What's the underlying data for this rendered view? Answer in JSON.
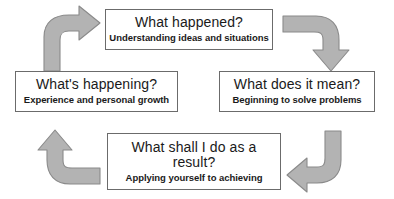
{
  "diagram": {
    "colors": {
      "arrow_fill": "#b3b3b3",
      "arrow_stroke": "#8a8a8a",
      "box_border": "#6b6b6b",
      "text": "#1a1a1a",
      "background": "#ffffff"
    },
    "nodes": [
      {
        "id": "what-happened",
        "title": "What happened?",
        "subtitle": "Understanding ideas and situations",
        "position": "top"
      },
      {
        "id": "what-does-it-mean",
        "title": "What does it mean?",
        "subtitle": "Beginning to solve problems",
        "position": "right"
      },
      {
        "id": "what-shall-i-do",
        "title": "What shall I do as a\nresult?",
        "subtitle": "Applying yourself to achieving",
        "position": "bottom"
      },
      {
        "id": "whats-happening",
        "title": "What's happening?",
        "subtitle": "Experience and personal growth",
        "position": "left"
      }
    ],
    "arrows": [
      {
        "id": "arrow-left-to-top",
        "from": "whats-happening",
        "to": "what-happened",
        "direction": "up-then-right",
        "name": "curved-arrow-up-right"
      },
      {
        "id": "arrow-top-to-right",
        "from": "what-happened",
        "to": "what-does-it-mean",
        "direction": "right-then-down",
        "name": "curved-arrow-right-down"
      },
      {
        "id": "arrow-right-to-bottom",
        "from": "what-does-it-mean",
        "to": "what-shall-i-do",
        "direction": "down-then-left",
        "name": "curved-arrow-down-left"
      },
      {
        "id": "arrow-bottom-to-left",
        "from": "what-shall-i-do",
        "to": "whats-happening",
        "direction": "left-then-up",
        "name": "curved-arrow-left-up"
      }
    ]
  }
}
